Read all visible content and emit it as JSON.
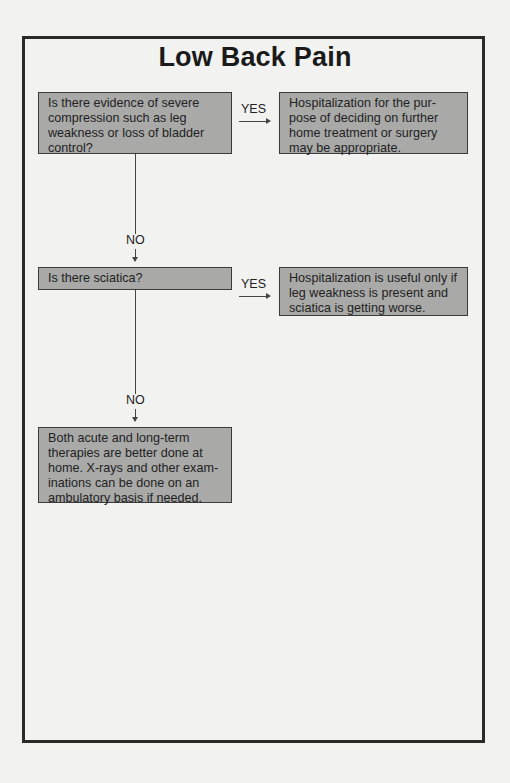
{
  "title": "Low Back Pain",
  "colors": {
    "paper": "#f2f2f1",
    "box_fill": "#a9a9a8",
    "box_border": "#3a3a3a",
    "frame_border": "#2a2a2a",
    "text": "#1e1e1e"
  },
  "nodes": {
    "q1": {
      "lines": [
        "Is there evidence of severe",
        "compression such as leg",
        "weakness or loss of bladder",
        "control?"
      ]
    },
    "a1": {
      "lines": [
        "Hospitalization for the pur-",
        "pose of deciding on further",
        "home treatment or surgery",
        "may be appropriate."
      ]
    },
    "q2": {
      "lines": [
        "Is there sciatica?"
      ]
    },
    "a2": {
      "lines": [
        "Hospitalization is useful only if",
        "leg weakness is present and",
        "sciatica is getting worse."
      ]
    },
    "end": {
      "lines": [
        "Both acute and long-term",
        "therapies are better done at",
        "home. X-rays and other exam-",
        "inations can be done on an",
        "ambulatory basis if needed."
      ]
    }
  },
  "edges": {
    "q1_yes": "YES",
    "q1_no": "NO",
    "q2_yes": "YES",
    "q2_no": "NO"
  }
}
